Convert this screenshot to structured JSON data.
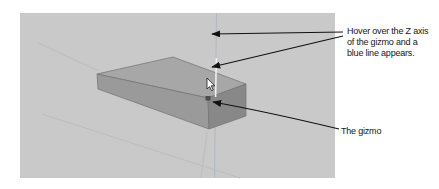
{
  "figure": {
    "page_bg": "#ffffff",
    "viewport_bg": "#c9c9c9"
  },
  "viewport": {
    "box": {
      "top_color": "#a7a7a7",
      "left_color": "#9a9a9a",
      "right_color": "#888888",
      "edge_color": "#757575"
    },
    "z_axis": {
      "color": "#b2b7c0",
      "highlight_color": "#eef0f5"
    },
    "ground_line_color": "#bdbdbd",
    "gizmo_origin_color": "#4d4d4d",
    "cursor_fill": "#ffffff",
    "cursor_stroke": "#1a1a1a"
  },
  "annotations": {
    "arrow_color": "#111111",
    "text_color": "#161616",
    "hover_note_lines": {
      "0": "Hover over the Z axis",
      "1": "of the gizmo and a",
      "2": "blue line appears."
    },
    "gizmo_label": "The gizmo"
  }
}
